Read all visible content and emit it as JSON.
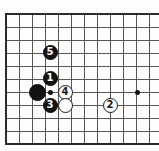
{
  "figure": {
    "kind": "go-board-diagram",
    "title": "",
    "width": 159,
    "height": 151,
    "background_color": "#fdfdfb"
  },
  "board": {
    "line_color": "#575757",
    "edge_color": "#2b2b2b",
    "cell_size": 13,
    "vertical_lines_x": [
      6,
      19,
      32,
      45,
      58,
      71,
      84,
      97,
      110,
      123,
      136,
      149
    ],
    "horizontal_lines_y": [
      14,
      27,
      40,
      53,
      66,
      79,
      92,
      105,
      118,
      131,
      144
    ],
    "edges": {
      "left_x": 6,
      "top_y": 14,
      "bottom_y": 144
    },
    "star_points": [
      {
        "name": "hoshi-left",
        "x": 50,
        "y": 92
      },
      {
        "name": "hoshi-right",
        "x": 137,
        "y": 92
      }
    ]
  },
  "stones": [
    {
      "id": "black-corner",
      "color": "black",
      "label": "",
      "x": 37,
      "y": 92,
      "size": "big"
    },
    {
      "id": "black-1",
      "color": "black",
      "label": "1",
      "x": 50,
      "y": 78,
      "size": "reg"
    },
    {
      "id": "black-3",
      "color": "black",
      "label": "3",
      "x": 50,
      "y": 105,
      "size": "reg"
    },
    {
      "id": "black-5",
      "color": "black",
      "label": "5",
      "x": 50,
      "y": 52,
      "size": "reg"
    },
    {
      "id": "white-4",
      "color": "white",
      "label": "4",
      "x": 65,
      "y": 92,
      "size": "reg"
    },
    {
      "id": "white-plain",
      "color": "white",
      "label": "",
      "x": 65,
      "y": 105,
      "size": "reg"
    },
    {
      "id": "white-2",
      "color": "white",
      "label": "2",
      "x": 110,
      "y": 105,
      "size": "reg"
    }
  ],
  "colors": {
    "black_stone": "#131313",
    "white_stone": "#fefefe",
    "stone_outline": "#1a1a1a",
    "grid_line": "#575757"
  }
}
